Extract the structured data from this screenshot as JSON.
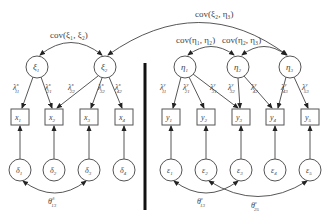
{
  "diagram": {
    "type": "structural-equation-model",
    "exogenous": {
      "latents": [
        {
          "id": "xi1",
          "symbol": "ξ",
          "sub": "1",
          "cx": 37,
          "cy": 67
        },
        {
          "id": "xi2",
          "symbol": "ξ",
          "sub": "2",
          "cx": 105,
          "cy": 67
        }
      ],
      "indicators": [
        {
          "id": "x1",
          "symbol": "x",
          "sub": "1",
          "cx": 20,
          "cy": 117
        },
        {
          "id": "x2",
          "symbol": "x",
          "sub": "2",
          "cx": 54,
          "cy": 117
        },
        {
          "id": "x3",
          "symbol": "x",
          "sub": "3",
          "cx": 89,
          "cy": 117
        },
        {
          "id": "x4",
          "symbol": "x",
          "sub": "4",
          "cx": 124,
          "cy": 117
        }
      ],
      "errors": [
        {
          "id": "d1",
          "symbol": "δ",
          "sub": "1",
          "cx": 20,
          "cy": 170
        },
        {
          "id": "d2",
          "symbol": "δ",
          "sub": "2",
          "cx": 54,
          "cy": 170
        },
        {
          "id": "d3",
          "symbol": "δ",
          "sub": "3",
          "cx": 89,
          "cy": 170
        },
        {
          "id": "d4",
          "symbol": "δ",
          "sub": "4",
          "cx": 124,
          "cy": 170
        }
      ],
      "loadings": [
        {
          "label": "λ",
          "sup": "x",
          "sub": "11",
          "from": "xi1",
          "to": "x1"
        },
        {
          "label": "λ",
          "sup": "x",
          "sub": "21",
          "from": "xi1",
          "to": "x2"
        },
        {
          "label": "λ",
          "sup": "x",
          "sub": "22",
          "from": "xi2",
          "to": "x2"
        },
        {
          "label": "λ",
          "sup": "x",
          "sub": "32",
          "from": "xi2",
          "to": "x3"
        },
        {
          "label": "λ",
          "sup": "x",
          "sub": "42",
          "from": "xi2",
          "to": "x4"
        }
      ],
      "error_covariances": [
        {
          "label": "θ",
          "sup": "δ",
          "sub": "13",
          "from": "d1",
          "to": "d3"
        }
      ]
    },
    "endogenous": {
      "latents": [
        {
          "id": "eta1",
          "symbol": "η",
          "sub": "1",
          "cx": 185,
          "cy": 67
        },
        {
          "id": "eta2",
          "symbol": "η",
          "sub": "2",
          "cx": 238,
          "cy": 67
        },
        {
          "id": "eta3",
          "symbol": "η",
          "sub": "3",
          "cx": 290,
          "cy": 67
        }
      ],
      "indicators": [
        {
          "id": "y1",
          "symbol": "y",
          "sub": "1",
          "cx": 171,
          "cy": 117
        },
        {
          "id": "y2",
          "symbol": "y",
          "sub": "2",
          "cx": 206,
          "cy": 117
        },
        {
          "id": "y3",
          "symbol": "y",
          "sub": "3",
          "cx": 241,
          "cy": 117
        },
        {
          "id": "y4",
          "symbol": "y",
          "sub": "4",
          "cx": 275,
          "cy": 117
        },
        {
          "id": "y5",
          "symbol": "y",
          "sub": "5",
          "cx": 310,
          "cy": 117
        }
      ],
      "errors": [
        {
          "id": "e1",
          "symbol": "ε",
          "sub": "1",
          "cx": 171,
          "cy": 170
        },
        {
          "id": "e2",
          "symbol": "ε",
          "sub": "2",
          "cx": 206,
          "cy": 170
        },
        {
          "id": "e3",
          "symbol": "ε",
          "sub": "3",
          "cx": 241,
          "cy": 170
        },
        {
          "id": "e4",
          "symbol": "ε",
          "sub": "4",
          "cx": 275,
          "cy": 170
        },
        {
          "id": "e5",
          "symbol": "ε",
          "sub": "5",
          "cx": 310,
          "cy": 170
        }
      ],
      "loadings": [
        {
          "label": "λ",
          "sup": "y",
          "sub": "11",
          "from": "eta1",
          "to": "y1"
        },
        {
          "label": "λ",
          "sup": "y",
          "sub": "21",
          "from": "eta1",
          "to": "y2"
        },
        {
          "label": "λ",
          "sup": "y",
          "sub": "31",
          "from": "eta1",
          "to": "y3"
        },
        {
          "label": "λ",
          "sup": "y",
          "sub": "32",
          "from": "eta2",
          "to": "y3"
        },
        {
          "label": "λ",
          "sup": "y",
          "sub": "42",
          "from": "eta2",
          "to": "y4"
        },
        {
          "label": "λ",
          "sup": "y",
          "sub": "43",
          "from": "eta3",
          "to": "y4"
        },
        {
          "label": "λ",
          "sup": "y",
          "sub": "53",
          "from": "eta3",
          "to": "y5"
        }
      ],
      "error_covariances": [
        {
          "label": "θ",
          "sup": "ε",
          "sub": "13",
          "from": "e1",
          "to": "e3"
        },
        {
          "label": "θ",
          "sup": "ε",
          "sub": "25",
          "from": "e2",
          "to": "e5"
        }
      ]
    },
    "covariances": [
      {
        "label": "cov(ξ₁, ξ₂)",
        "from": "xi1",
        "to": "xi2"
      },
      {
        "label": "cov(ξ₂, η₃)",
        "from": "xi2",
        "to": "eta3"
      },
      {
        "label": "cov(η₁, η₂)",
        "from": "eta1",
        "to": "eta2"
      },
      {
        "label": "cov(η₂, η₃)",
        "from": "eta2",
        "to": "eta3"
      }
    ]
  }
}
